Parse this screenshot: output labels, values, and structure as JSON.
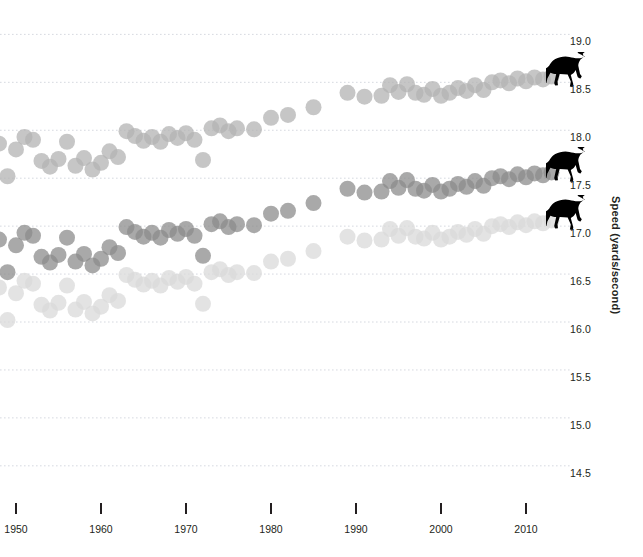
{
  "chart_data": {
    "type": "scatter",
    "title": "",
    "subtitle": "",
    "xlabel": "",
    "ylabel": "Speed (yards/second)",
    "xlim": [
      1944,
      2014
    ],
    "ylim": [
      14.3,
      19.15
    ],
    "grid": true,
    "grid_style": "dotted",
    "legend": "none",
    "x_ticks": [
      1950,
      1960,
      1970,
      1980,
      1990,
      2000,
      2010
    ],
    "x_tick_labels": [
      "1950",
      "1960",
      "1970",
      "1980",
      "1990",
      "2000",
      "2010"
    ],
    "y_ticks": [
      14.5,
      15.0,
      15.5,
      16.0,
      16.5,
      17.0,
      17.5,
      18.0,
      18.5,
      19.0
    ],
    "y_tick_labels": [
      "14.5",
      "15.0",
      "15.5",
      "16.0",
      "16.5",
      "17.0",
      "17.5",
      "18.0",
      "18.5",
      "19.0"
    ],
    "marker": "circle",
    "marker_size": 16,
    "marker_opacity": 0.75,
    "series": [
      {
        "name": "top-series",
        "color": "#b3b3b3",
        "end_marker_icon": "horse-icon",
        "end_marker_value": 18.55,
        "points": [
          [
            1945,
            17.84
          ],
          [
            1946,
            17.63
          ],
          [
            1947,
            17.58
          ],
          [
            1948,
            17.86
          ],
          [
            1949,
            17.52
          ],
          [
            1950,
            17.8
          ],
          [
            1951,
            17.93
          ],
          [
            1952,
            17.9
          ],
          [
            1953,
            17.68
          ],
          [
            1954,
            17.62
          ],
          [
            1955,
            17.7
          ],
          [
            1956,
            17.88
          ],
          [
            1957,
            17.63
          ],
          [
            1958,
            17.71
          ],
          [
            1959,
            17.59
          ],
          [
            1960,
            17.66
          ],
          [
            1961,
            17.78
          ],
          [
            1962,
            17.72
          ],
          [
            1963,
            17.99
          ],
          [
            1964,
            17.94
          ],
          [
            1965,
            17.89
          ],
          [
            1966,
            17.93
          ],
          [
            1967,
            17.88
          ],
          [
            1968,
            17.96
          ],
          [
            1969,
            17.92
          ],
          [
            1970,
            17.97
          ],
          [
            1971,
            17.9
          ],
          [
            1972,
            17.69
          ],
          [
            1973,
            18.02
          ],
          [
            1974,
            18.05
          ],
          [
            1975,
            17.99
          ],
          [
            1976,
            18.02
          ],
          [
            1978,
            18.01
          ],
          [
            1980,
            18.13
          ],
          [
            1982,
            18.16
          ],
          [
            1985,
            18.24
          ],
          [
            1989,
            18.39
          ],
          [
            1991,
            18.35
          ],
          [
            1993,
            18.36
          ],
          [
            1994,
            18.47
          ],
          [
            1995,
            18.4
          ],
          [
            1996,
            18.48
          ],
          [
            1997,
            18.39
          ],
          [
            1998,
            18.37
          ],
          [
            1999,
            18.43
          ],
          [
            2000,
            18.36
          ],
          [
            2001,
            18.39
          ],
          [
            2002,
            18.44
          ],
          [
            2003,
            18.41
          ],
          [
            2004,
            18.47
          ],
          [
            2005,
            18.42
          ],
          [
            2006,
            18.5
          ],
          [
            2007,
            18.52
          ],
          [
            2008,
            18.49
          ],
          [
            2009,
            18.54
          ],
          [
            2010,
            18.51
          ],
          [
            2011,
            18.55
          ],
          [
            2012,
            18.53
          ],
          [
            2013,
            18.56
          ]
        ]
      },
      {
        "name": "middle-series",
        "color": "#8c8c8c",
        "end_marker_icon": "horse-icon",
        "end_marker_value": 17.55,
        "points": [
          [
            1945,
            16.84
          ],
          [
            1946,
            16.63
          ],
          [
            1947,
            16.58
          ],
          [
            1948,
            16.86
          ],
          [
            1949,
            16.52
          ],
          [
            1950,
            16.8
          ],
          [
            1951,
            16.93
          ],
          [
            1952,
            16.9
          ],
          [
            1953,
            16.68
          ],
          [
            1954,
            16.62
          ],
          [
            1955,
            16.7
          ],
          [
            1956,
            16.88
          ],
          [
            1957,
            16.63
          ],
          [
            1958,
            16.71
          ],
          [
            1959,
            16.59
          ],
          [
            1960,
            16.66
          ],
          [
            1961,
            16.78
          ],
          [
            1962,
            16.72
          ],
          [
            1963,
            16.99
          ],
          [
            1964,
            16.94
          ],
          [
            1965,
            16.89
          ],
          [
            1966,
            16.93
          ],
          [
            1967,
            16.88
          ],
          [
            1968,
            16.96
          ],
          [
            1969,
            16.92
          ],
          [
            1970,
            16.97
          ],
          [
            1971,
            16.9
          ],
          [
            1972,
            16.69
          ],
          [
            1973,
            17.02
          ],
          [
            1974,
            17.05
          ],
          [
            1975,
            16.99
          ],
          [
            1976,
            17.02
          ],
          [
            1978,
            17.01
          ],
          [
            1980,
            17.13
          ],
          [
            1982,
            17.16
          ],
          [
            1985,
            17.24
          ],
          [
            1989,
            17.39
          ],
          [
            1991,
            17.35
          ],
          [
            1993,
            17.36
          ],
          [
            1994,
            17.47
          ],
          [
            1995,
            17.4
          ],
          [
            1996,
            17.48
          ],
          [
            1997,
            17.39
          ],
          [
            1998,
            17.37
          ],
          [
            1999,
            17.43
          ],
          [
            2000,
            17.36
          ],
          [
            2001,
            17.39
          ],
          [
            2002,
            17.44
          ],
          [
            2003,
            17.41
          ],
          [
            2004,
            17.47
          ],
          [
            2005,
            17.42
          ],
          [
            2006,
            17.5
          ],
          [
            2007,
            17.52
          ],
          [
            2008,
            17.49
          ],
          [
            2009,
            17.54
          ],
          [
            2010,
            17.51
          ],
          [
            2011,
            17.55
          ],
          [
            2012,
            17.53
          ],
          [
            2013,
            17.56
          ]
        ]
      },
      {
        "name": "bottom-series",
        "color": "#d9d9d9",
        "end_marker_icon": "horse-icon",
        "end_marker_value": 17.05,
        "points": [
          [
            1945,
            16.34
          ],
          [
            1946,
            16.13
          ],
          [
            1947,
            16.08
          ],
          [
            1948,
            16.36
          ],
          [
            1949,
            16.02
          ],
          [
            1950,
            16.3
          ],
          [
            1951,
            16.43
          ],
          [
            1952,
            16.4
          ],
          [
            1953,
            16.18
          ],
          [
            1954,
            16.12
          ],
          [
            1955,
            16.2
          ],
          [
            1956,
            16.38
          ],
          [
            1957,
            16.13
          ],
          [
            1958,
            16.21
          ],
          [
            1959,
            16.09
          ],
          [
            1960,
            16.16
          ],
          [
            1961,
            16.28
          ],
          [
            1962,
            16.22
          ],
          [
            1963,
            16.49
          ],
          [
            1964,
            16.44
          ],
          [
            1965,
            16.39
          ],
          [
            1966,
            16.43
          ],
          [
            1967,
            16.38
          ],
          [
            1968,
            16.46
          ],
          [
            1969,
            16.42
          ],
          [
            1970,
            16.47
          ],
          [
            1971,
            16.4
          ],
          [
            1972,
            16.19
          ],
          [
            1973,
            16.52
          ],
          [
            1974,
            16.55
          ],
          [
            1975,
            16.49
          ],
          [
            1976,
            16.52
          ],
          [
            1978,
            16.51
          ],
          [
            1980,
            16.63
          ],
          [
            1982,
            16.66
          ],
          [
            1985,
            16.74
          ],
          [
            1989,
            16.89
          ],
          [
            1991,
            16.85
          ],
          [
            1993,
            16.86
          ],
          [
            1994,
            16.97
          ],
          [
            1995,
            16.9
          ],
          [
            1996,
            16.98
          ],
          [
            1997,
            16.89
          ],
          [
            1998,
            16.87
          ],
          [
            1999,
            16.93
          ],
          [
            2000,
            16.86
          ],
          [
            2001,
            16.89
          ],
          [
            2002,
            16.94
          ],
          [
            2003,
            16.91
          ],
          [
            2004,
            16.97
          ],
          [
            2005,
            16.92
          ],
          [
            2006,
            17.0
          ],
          [
            2007,
            17.02
          ],
          [
            2008,
            16.99
          ],
          [
            2009,
            17.04
          ],
          [
            2010,
            17.01
          ],
          [
            2011,
            17.05
          ],
          [
            2012,
            17.03
          ],
          [
            2013,
            17.06
          ]
        ]
      }
    ]
  }
}
